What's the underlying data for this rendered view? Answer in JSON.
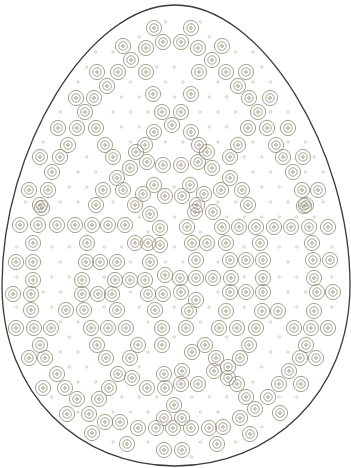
{
  "colors": {
    "background": "#ffffff",
    "outline": "#3a3a3a",
    "ring": "#8e8a72",
    "dot": "#a8a494"
  },
  "egg": {
    "path": "M175,5 C262,5 350,150 350,285 C350,395 270,466 175,466 C80,466 2,395 2,285 C2,150 88,5 175,5 Z",
    "stroke_width": 1.3
  },
  "ring_style": {
    "outer_r": 7.6,
    "inner_r": 4.2,
    "center_r": 1.3,
    "stroke_width": 0.8
  },
  "dot_style": {
    "r": 1.2,
    "stroke_width": 0.5
  },
  "dot_grid": {
    "x0": 8,
    "y0": 22,
    "dx": 17.5,
    "dy": 15,
    "row_offset": 8.75,
    "min_clear": 11
  },
  "circles": [
    [
      154,
      28
    ],
    [
      191,
      28
    ],
    [
      163,
      42
    ],
    [
      181,
      42
    ],
    [
      123,
      46
    ],
    [
      146,
      48
    ],
    [
      198,
      48
    ],
    [
      222,
      46
    ],
    [
      131,
      60
    ],
    [
      212,
      60
    ],
    [
      97,
      72
    ],
    [
      118,
      72
    ],
    [
      146,
      72
    ],
    [
      199,
      72
    ],
    [
      226,
      72
    ],
    [
      246,
      72
    ],
    [
      107,
      86
    ],
    [
      238,
      86
    ],
    [
      76,
      98
    ],
    [
      94,
      98
    ],
    [
      153,
      94
    ],
    [
      191,
      94
    ],
    [
      249,
      98
    ],
    [
      270,
      98
    ],
    [
      85,
      112
    ],
    [
      162,
      112
    ],
    [
      181,
      112
    ],
    [
      258,
      112
    ],
    [
      172,
      125
    ],
    [
      58,
      128
    ],
    [
      77,
      128
    ],
    [
      96,
      128
    ],
    [
      154,
      132
    ],
    [
      191,
      132
    ],
    [
      248,
      128
    ],
    [
      267,
      128
    ],
    [
      288,
      128
    ],
    [
      68,
      145
    ],
    [
      105,
      145
    ],
    [
      145,
      145
    ],
    [
      199,
      145
    ],
    [
      238,
      145
    ],
    [
      276,
      145
    ],
    [
      136,
      152
    ],
    [
      207,
      152
    ],
    [
      40,
      157
    ],
    [
      60,
      157
    ],
    [
      113,
      157
    ],
    [
      130,
      168
    ],
    [
      163,
      165
    ],
    [
      181,
      165
    ],
    [
      212,
      168
    ],
    [
      230,
      157
    ],
    [
      283,
      157
    ],
    [
      303,
      157
    ],
    [
      147,
      162
    ],
    [
      198,
      162
    ],
    [
      52,
      172
    ],
    [
      293,
      172
    ],
    [
      117,
      178
    ],
    [
      230,
      178
    ],
    [
      154,
      185
    ],
    [
      190,
      185
    ],
    [
      29,
      190
    ],
    [
      48,
      190
    ],
    [
      103,
      190
    ],
    [
      123,
      190
    ],
    [
      143,
      194
    ],
    [
      165,
      196
    ],
    [
      182,
      196
    ],
    [
      204,
      194
    ],
    [
      221,
      190
    ],
    [
      242,
      190
    ],
    [
      302,
      190
    ],
    [
      318,
      190
    ],
    [
      40,
      205
    ],
    [
      306,
      205
    ],
    [
      96,
      205
    ],
    [
      135,
      205
    ],
    [
      197,
      205
    ],
    [
      248,
      205
    ],
    [
      42,
      208
    ],
    [
      304,
      206
    ],
    [
      150,
      214
    ],
    [
      195,
      212
    ],
    [
      213,
      212
    ],
    [
      20,
      225
    ],
    [
      38,
      225
    ],
    [
      57,
      225
    ],
    [
      75,
      225
    ],
    [
      92,
      225
    ],
    [
      108,
      225
    ],
    [
      125,
      225
    ],
    [
      160,
      228
    ],
    [
      187,
      227
    ],
    [
      222,
      227
    ],
    [
      239,
      227
    ],
    [
      256,
      227
    ],
    [
      274,
      227
    ],
    [
      291,
      227
    ],
    [
      309,
      227
    ],
    [
      328,
      227
    ],
    [
      33,
      243
    ],
    [
      87,
      243
    ],
    [
      135,
      243
    ],
    [
      148,
      243
    ],
    [
      160,
      245
    ],
    [
      192,
      243
    ],
    [
      207,
      243
    ],
    [
      226,
      243
    ],
    [
      260,
      243
    ],
    [
      312,
      243
    ],
    [
      16,
      262
    ],
    [
      33,
      262
    ],
    [
      86,
      262
    ],
    [
      100,
      262
    ],
    [
      117,
      262
    ],
    [
      150,
      262
    ],
    [
      196,
      260
    ],
    [
      230,
      260
    ],
    [
      246,
      260
    ],
    [
      263,
      260
    ],
    [
      313,
      260
    ],
    [
      330,
      260
    ],
    [
      165,
      275
    ],
    [
      33,
      280
    ],
    [
      82,
      280
    ],
    [
      115,
      280
    ],
    [
      130,
      280
    ],
    [
      145,
      280
    ],
    [
      180,
      278
    ],
    [
      196,
      278
    ],
    [
      213,
      278
    ],
    [
      231,
      278
    ],
    [
      263,
      278
    ],
    [
      314,
      278
    ],
    [
      13,
      294
    ],
    [
      31,
      294
    ],
    [
      82,
      294
    ],
    [
      98,
      294
    ],
    [
      112,
      294
    ],
    [
      148,
      294
    ],
    [
      163,
      294
    ],
    [
      181,
      292
    ],
    [
      230,
      292
    ],
    [
      246,
      292
    ],
    [
      263,
      292
    ],
    [
      317,
      292
    ],
    [
      333,
      292
    ],
    [
      196,
      300
    ],
    [
      31,
      310
    ],
    [
      66,
      310
    ],
    [
      84,
      310
    ],
    [
      117,
      310
    ],
    [
      155,
      310
    ],
    [
      189,
      311
    ],
    [
      226,
      311
    ],
    [
      262,
      311
    ],
    [
      278,
      311
    ],
    [
      314,
      311
    ],
    [
      16,
      328
    ],
    [
      34,
      328
    ],
    [
      51,
      328
    ],
    [
      91,
      328
    ],
    [
      108,
      328
    ],
    [
      126,
      328
    ],
    [
      162,
      328
    ],
    [
      186,
      328
    ],
    [
      219,
      328
    ],
    [
      237,
      328
    ],
    [
      256,
      328
    ],
    [
      294,
      328
    ],
    [
      311,
      328
    ],
    [
      328,
      328
    ],
    [
      40,
      345
    ],
    [
      97,
      345
    ],
    [
      138,
      345
    ],
    [
      162,
      345
    ],
    [
      205,
      345
    ],
    [
      249,
      345
    ],
    [
      306,
      345
    ],
    [
      192,
      352
    ],
    [
      29,
      358
    ],
    [
      45,
      358
    ],
    [
      106,
      358
    ],
    [
      130,
      358
    ],
    [
      216,
      358
    ],
    [
      240,
      358
    ],
    [
      300,
      358
    ],
    [
      316,
      358
    ],
    [
      228,
      367
    ],
    [
      57,
      374
    ],
    [
      118,
      374
    ],
    [
      164,
      374
    ],
    [
      182,
      371
    ],
    [
      214,
      371
    ],
    [
      289,
      371
    ],
    [
      132,
      378
    ],
    [
      228,
      378
    ],
    [
      43,
      388
    ],
    [
      65,
      388
    ],
    [
      109,
      388
    ],
    [
      147,
      388
    ],
    [
      165,
      388
    ],
    [
      181,
      384
    ],
    [
      198,
      384
    ],
    [
      237,
      384
    ],
    [
      279,
      384
    ],
    [
      301,
      384
    ],
    [
      77,
      399
    ],
    [
      99,
      399
    ],
    [
      246,
      397
    ],
    [
      268,
      397
    ],
    [
      174,
      405
    ],
    [
      255,
      409
    ],
    [
      67,
      414
    ],
    [
      89,
      414
    ],
    [
      280,
      413
    ],
    [
      164,
      418
    ],
    [
      182,
      418
    ],
    [
      240,
      418
    ],
    [
      105,
      422
    ],
    [
      120,
      422
    ],
    [
      138,
      428
    ],
    [
      156,
      428
    ],
    [
      173,
      428
    ],
    [
      191,
      428
    ],
    [
      209,
      428
    ],
    [
      223,
      427
    ],
    [
      92,
      433
    ],
    [
      250,
      434
    ],
    [
      127,
      444
    ],
    [
      217,
      444
    ],
    [
      164,
      450
    ],
    [
      182,
      450
    ]
  ]
}
